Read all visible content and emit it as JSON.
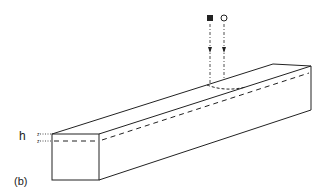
{
  "figure": {
    "panel_label": "(b)",
    "dimension_label": "h",
    "markers": [
      {
        "shape": "filled-square",
        "meaning": "incident beam marker 1"
      },
      {
        "shape": "open-circle",
        "meaning": "incident beam marker 2"
      }
    ],
    "colors": {
      "line": "#222222",
      "background": "#ffffff"
    }
  }
}
